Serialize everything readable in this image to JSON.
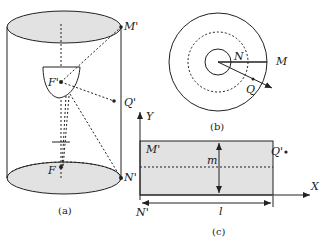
{
  "figure": {
    "panel_a": {
      "caption": "(a)",
      "labels": {
        "M_prime": "M'",
        "F_prime": "F'",
        "Q_prime": "Q'",
        "F": "F",
        "N_prime": "N'"
      }
    },
    "panel_b": {
      "caption": "(b)",
      "labels": {
        "N": "N",
        "M": "M",
        "Q": "Q"
      }
    },
    "panel_c": {
      "caption": "(c)",
      "labels": {
        "Y": "Y",
        "X": "X",
        "M_prime": "M'",
        "m": "m",
        "Q_prime": "Q'",
        "N_prime": "N'",
        "l": "l"
      }
    },
    "colors": {
      "fill": "#e2e2e2",
      "stroke": "#222222"
    }
  }
}
